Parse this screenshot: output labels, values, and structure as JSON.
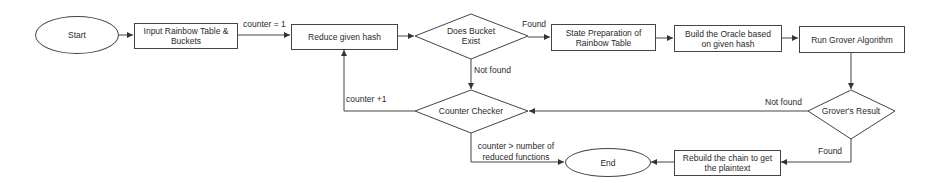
{
  "diagram": {
    "type": "flowchart",
    "nodes": {
      "start": {
        "label": "Start",
        "shape": "ellipse"
      },
      "input": {
        "label": "Input Rainbow Table & Buckets",
        "shape": "rect"
      },
      "reduce": {
        "label": "Reduce given hash",
        "shape": "rect"
      },
      "bucket_exist": {
        "label": "Does Bucket Exist",
        "shape": "diamond"
      },
      "state_prep": {
        "label": "State Preparation of Rainbow Table",
        "shape": "rect"
      },
      "oracle": {
        "label": "Build the Oracle based on given hash",
        "shape": "rect"
      },
      "grover": {
        "label": "Run Grover Algorithm",
        "shape": "rect"
      },
      "grover_result": {
        "label": "Grover's Result",
        "shape": "diamond"
      },
      "counter_checker": {
        "label": "Counter Checker",
        "shape": "diamond"
      },
      "rebuild": {
        "label": "Rebuild the chain to get the plaintext",
        "shape": "rect"
      },
      "end": {
        "label": "End",
        "shape": "ellipse"
      }
    },
    "edge_labels": {
      "counter_init": "counter = 1",
      "bucket_found": "Found",
      "bucket_not_found": "Not found",
      "counter_increment": "counter +1",
      "grover_not_found": "Not found",
      "grover_found": "Found",
      "counter_exceeded": "counter > number of reduced functions"
    },
    "edges": [
      {
        "from": "start",
        "to": "input"
      },
      {
        "from": "input",
        "to": "reduce",
        "label": "counter = 1"
      },
      {
        "from": "reduce",
        "to": "bucket_exist"
      },
      {
        "from": "bucket_exist",
        "to": "state_prep",
        "label": "Found"
      },
      {
        "from": "bucket_exist",
        "to": "counter_checker",
        "label": "Not found"
      },
      {
        "from": "state_prep",
        "to": "oracle"
      },
      {
        "from": "oracle",
        "to": "grover"
      },
      {
        "from": "grover",
        "to": "grover_result"
      },
      {
        "from": "grover_result",
        "to": "counter_checker",
        "label": "Not found"
      },
      {
        "from": "grover_result",
        "to": "rebuild",
        "label": "Found"
      },
      {
        "from": "counter_checker",
        "to": "reduce",
        "label": "counter +1"
      },
      {
        "from": "counter_checker",
        "to": "end",
        "label": "counter > number of reduced functions"
      },
      {
        "from": "rebuild",
        "to": "end"
      }
    ]
  },
  "colors": {
    "stroke": "#444444",
    "text": "#2a2a2a",
    "background": "#ffffff"
  }
}
